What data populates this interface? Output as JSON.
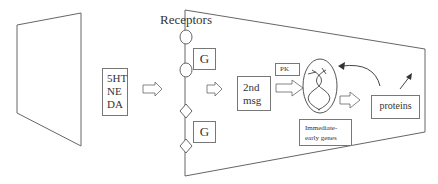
{
  "diagram": {
    "title_label": "Receptors",
    "neurotransmitters": [
      "5HT",
      "NE",
      "DA"
    ],
    "g_protein_top": "G",
    "g_protein_bottom": "G",
    "second_messenger": [
      "2nd",
      "msg"
    ],
    "protein_kinase": "PK",
    "immediate_early_genes": [
      "Immediate-",
      "early genes"
    ],
    "proteins": "proteins",
    "colors": {
      "stroke": "#555555",
      "box_border": "#777777",
      "text": "#333333",
      "background": "#ffffff"
    }
  }
}
